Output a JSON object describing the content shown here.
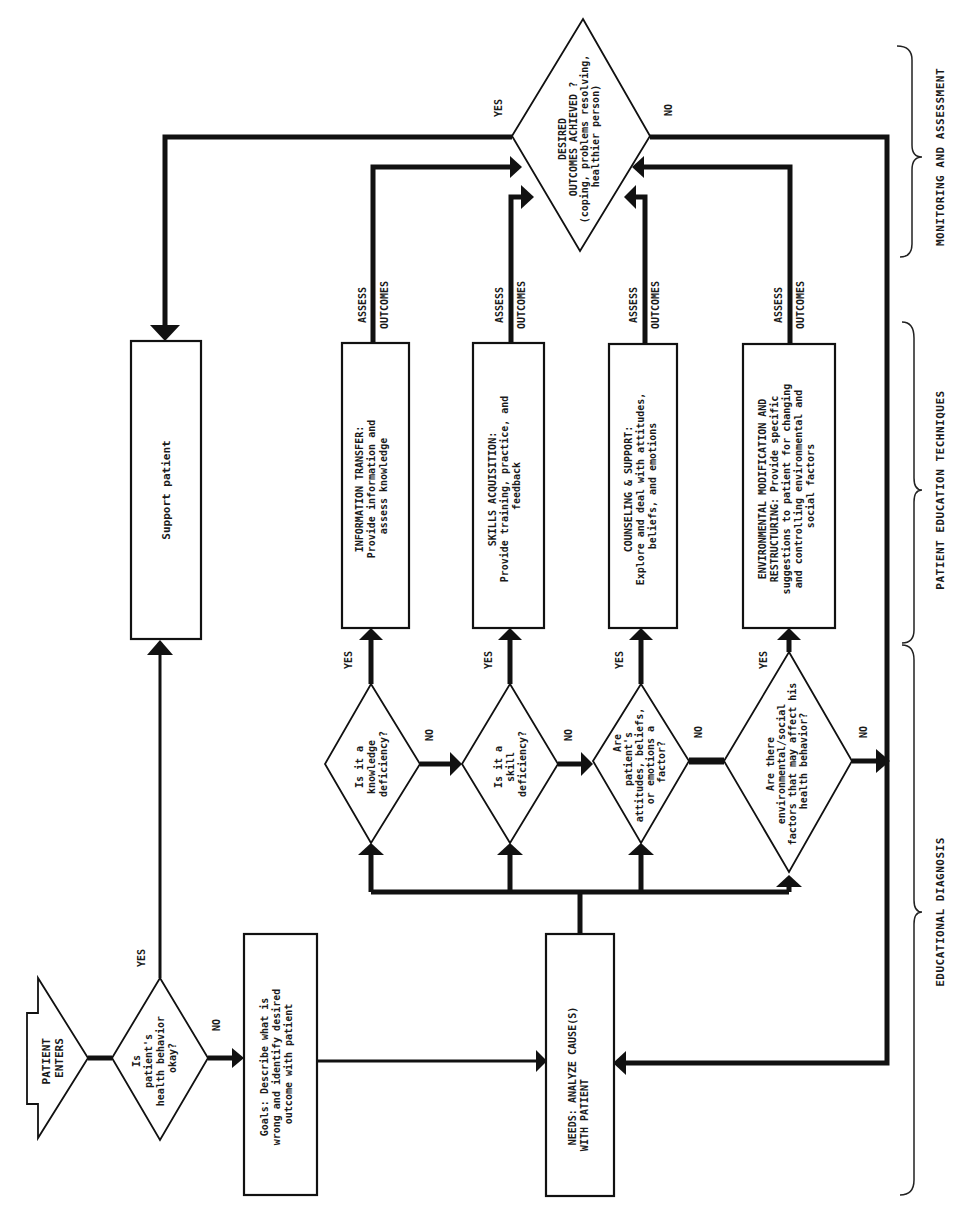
{
  "diagram": {
    "orientation": "rotated-90-ccw",
    "colors": {
      "ink": "#111111",
      "background": "#ffffff"
    },
    "start": {
      "label_lines": [
        "PATIENT",
        "ENTERS"
      ]
    },
    "decision_health": {
      "lines": [
        "Is",
        "patient's",
        "health behavior",
        "okay?"
      ],
      "yes": "YES",
      "no": "NO"
    },
    "goals": {
      "lines": [
        "Goals:  Describe what is",
        "wrong and identify desired",
        "outcome with patient"
      ]
    },
    "needs": {
      "lines": [
        "NEEDS:  ANALYZE CAUSE(S)",
        "WITH PATIENT"
      ]
    },
    "support": {
      "label": "Support patient"
    },
    "decisions": [
      {
        "lines": [
          "Is it a",
          "knowledge",
          "deficiency?"
        ],
        "yes": "YES",
        "no": "NO"
      },
      {
        "lines": [
          "Is it a",
          "skill",
          "deficiency?"
        ],
        "yes": "YES",
        "no": "NO"
      },
      {
        "lines": [
          "Are",
          "patient's",
          "attitudes, beliefs,",
          "or emotions a",
          "factor?"
        ],
        "yes": "YES",
        "no": "NO"
      },
      {
        "lines": [
          "Are there",
          "environmental/social",
          "factors that may affect his",
          "health behavior?"
        ],
        "yes": "YES",
        "no": "NO"
      }
    ],
    "techniques": [
      {
        "lines": [
          "INFORMATION TRANSFER:",
          "Provide information and",
          "assess knowledge"
        ]
      },
      {
        "lines": [
          "SKILLS ACQUISITION:",
          "Provide training, practice, and",
          "feedback"
        ]
      },
      {
        "lines": [
          "COUNSELING & SUPPORT:",
          "Explore and deal with attitudes,",
          "beliefs, and emotions"
        ]
      },
      {
        "lines": [
          "ENVIRONMENTAL MODIFICATION AND",
          "RESTRUCTURING:  Provide specific",
          "suggestions to patient for changing",
          "and controlling environmental and",
          "social factors"
        ]
      }
    ],
    "assess_label": {
      "a": "ASSESS",
      "b": "OUTCOMES"
    },
    "outcome_decision": {
      "lines": [
        "DESIRED",
        "OUTCOMES ACHIEVED ?",
        "(coping, problems resolving,",
        "healthier person)"
      ],
      "yes": "YES",
      "no": "NO"
    },
    "sections": [
      {
        "label": "MONITORING AND ASSESSMENT"
      },
      {
        "label": "PATIENT EDUCATION TECHNIQUES"
      },
      {
        "label": "EDUCATIONAL DIAGNOSIS"
      }
    ]
  }
}
